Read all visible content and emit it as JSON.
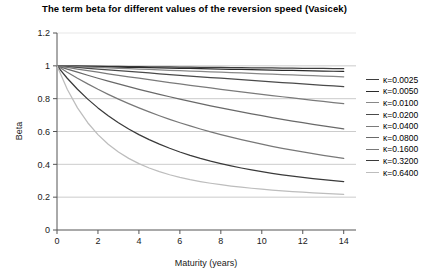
{
  "chart_data": {
    "type": "line",
    "title": "The term beta for different values of the reversion speed (Vasicek)",
    "xlabel": "Maturity (years)",
    "ylabel": "Beta",
    "xlim": [
      0,
      14.6
    ],
    "ylim": [
      0,
      1.2
    ],
    "xticks": [
      0,
      2,
      4,
      6,
      8,
      10,
      12,
      14
    ],
    "yticks": [
      0,
      0.2,
      0.4,
      0.6,
      0.8,
      1,
      1.2
    ],
    "ytick_labels": [
      "0",
      "0.2",
      "0.4",
      "0.6",
      "0.8",
      "1",
      "1.2"
    ],
    "xtick_labels": [
      "0",
      "2",
      "4",
      "6",
      "8",
      "10",
      "12",
      "14"
    ],
    "grid": "horizontal",
    "grid_color": "#b9b9b9",
    "legend_position": "right",
    "x": [
      0,
      0.5,
      1,
      1.5,
      2,
      2.5,
      3,
      3.5,
      4,
      4.5,
      5,
      5.5,
      6,
      6.5,
      7,
      7.5,
      8,
      8.5,
      9,
      9.5,
      10,
      10.5,
      11,
      11.5,
      12,
      12.5,
      13,
      13.5,
      14
    ],
    "series": [
      {
        "name": "κ=0.0025",
        "kappa": 0.0025,
        "color": "#3d3d3d",
        "values": [
          1,
          0.9994,
          0.9988,
          0.9981,
          0.9975,
          0.9969,
          0.9963,
          0.9956,
          0.995,
          0.9944,
          0.9938,
          0.9931,
          0.9925,
          0.9919,
          0.9913,
          0.9906,
          0.99,
          0.9894,
          0.9888,
          0.9882,
          0.9875,
          0.9869,
          0.9863,
          0.9857,
          0.9851,
          0.9845,
          0.9838,
          0.9832,
          0.9826
        ]
      },
      {
        "name": "κ=0.0050",
        "kappa": 0.005,
        "color": "#2b2b2b",
        "values": [
          1,
          0.9988,
          0.9975,
          0.9963,
          0.995,
          0.9938,
          0.9925,
          0.9913,
          0.9901,
          0.9888,
          0.9876,
          0.9864,
          0.9851,
          0.9839,
          0.9827,
          0.9815,
          0.9803,
          0.979,
          0.9778,
          0.9766,
          0.9754,
          0.9742,
          0.973,
          0.9718,
          0.9706,
          0.9694,
          0.9682,
          0.967,
          0.9658
        ]
      },
      {
        "name": "κ=0.0100",
        "kappa": 0.01,
        "color": "#888888",
        "values": [
          1,
          0.9975,
          0.995,
          0.9925,
          0.9901,
          0.9876,
          0.9851,
          0.9827,
          0.9803,
          0.9778,
          0.9754,
          0.973,
          0.9706,
          0.9682,
          0.9658,
          0.9634,
          0.9611,
          0.9587,
          0.9564,
          0.954,
          0.9517,
          0.9494,
          0.9471,
          0.9448,
          0.9425,
          0.9402,
          0.9379,
          0.9356,
          0.9334
        ]
      },
      {
        "name": "κ=0.0200",
        "kappa": 0.02,
        "color": "#4a4a4a",
        "values": [
          1,
          0.995,
          0.9901,
          0.9851,
          0.9803,
          0.9754,
          0.9706,
          0.9658,
          0.9611,
          0.9564,
          0.9517,
          0.9471,
          0.9425,
          0.9379,
          0.9334,
          0.9289,
          0.9244,
          0.92,
          0.9156,
          0.9112,
          0.9069,
          0.9026,
          0.8983,
          0.894,
          0.8898,
          0.8856,
          0.8815,
          0.8774,
          0.8733
        ]
      },
      {
        "name": "κ=0.0400",
        "kappa": 0.04,
        "color": "#7a7a7a",
        "values": [
          1,
          0.9901,
          0.9803,
          0.9706,
          0.9611,
          0.9517,
          0.9425,
          0.9334,
          0.9244,
          0.9156,
          0.9069,
          0.8983,
          0.8898,
          0.8815,
          0.8733,
          0.8652,
          0.8572,
          0.8494,
          0.8416,
          0.834,
          0.8264,
          0.819,
          0.8117,
          0.8045,
          0.7973,
          0.7903,
          0.7834,
          0.7766,
          0.7698
        ]
      },
      {
        "name": "κ=0.0800",
        "kappa": 0.08,
        "color": "#696969",
        "values": [
          1,
          0.9803,
          0.9611,
          0.9425,
          0.9244,
          0.9069,
          0.8898,
          0.8733,
          0.8572,
          0.8416,
          0.8264,
          0.8117,
          0.7973,
          0.7834,
          0.7698,
          0.7567,
          0.7439,
          0.7314,
          0.7193,
          0.7076,
          0.6961,
          0.685,
          0.6742,
          0.6637,
          0.6535,
          0.6435,
          0.6339,
          0.6244,
          0.6153
        ]
      },
      {
        "name": "κ=0.1600",
        "kappa": 0.16,
        "color": "#787878",
        "values": [
          1,
          0.9611,
          0.9244,
          0.8898,
          0.8572,
          0.8264,
          0.7973,
          0.7698,
          0.7439,
          0.7193,
          0.6961,
          0.6742,
          0.6535,
          0.6339,
          0.6153,
          0.5977,
          0.5811,
          0.5653,
          0.5503,
          0.5362,
          0.5227,
          0.5099,
          0.4978,
          0.4862,
          0.4752,
          0.4648,
          0.4548,
          0.4453,
          0.4363
        ]
      },
      {
        "name": "κ=0.3200",
        "kappa": 0.32,
        "color": "#3a3a3a",
        "values": [
          1,
          0.9244,
          0.8572,
          0.7973,
          0.7439,
          0.6961,
          0.6535,
          0.6153,
          0.5811,
          0.5503,
          0.5227,
          0.4978,
          0.4752,
          0.4548,
          0.4363,
          0.4195,
          0.4042,
          0.3903,
          0.3776,
          0.366,
          0.3553,
          0.3455,
          0.3365,
          0.3282,
          0.3206,
          0.3135,
          0.3069,
          0.3008,
          0.2951
        ]
      },
      {
        "name": "κ=0.6400",
        "kappa": 0.64,
        "color": "#bdbdbd",
        "values": [
          1,
          0.8572,
          0.7439,
          0.6535,
          0.5811,
          0.5227,
          0.4752,
          0.4363,
          0.4042,
          0.3776,
          0.3553,
          0.3365,
          0.3206,
          0.3069,
          0.2951,
          0.2848,
          0.2758,
          0.2678,
          0.2607,
          0.2543,
          0.2486,
          0.2434,
          0.2387,
          0.2344,
          0.2305,
          0.2268,
          0.2235,
          0.2204,
          0.2175
        ]
      }
    ]
  }
}
